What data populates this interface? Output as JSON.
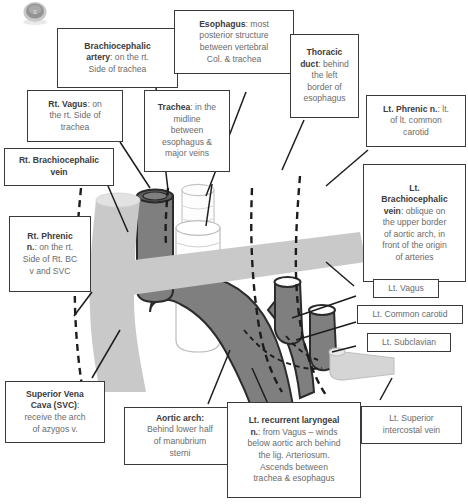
{
  "figure": {
    "kind": "anatomy-diagram",
    "watermark": "circular-logo-watermark"
  },
  "colors": {
    "vein": "#c9c9c9",
    "artery": "#7f7f7f",
    "outline": "#2b2b2b",
    "trachea": "#fdfdfd",
    "box_border": "#3a3a3a",
    "text": "#6b6b6b",
    "heading": "#3c3c3c",
    "background": "#ffffff"
  },
  "labels": [
    {
      "id": "brachiocephalic-artery",
      "term": "Brachiocephalic artery",
      "head": "Brachiocephalic artery:",
      "body": "on the rt. Side of trachea",
      "text": "Brachiocephalic artery: on the rt. Side of trachea"
    },
    {
      "id": "esophagus",
      "term": "Esophagus",
      "head": "Esophagus:",
      "body": "most posterior structure between vertebral Col. & trachea",
      "text": "Esophagus: most posterior structure between vertebral Col. & trachea"
    },
    {
      "id": "thoracic-duct",
      "term": "Thoracic duct",
      "head": "Thoracic duct:",
      "body": "behind the left border of esophagus",
      "text": "Thoracic duct: behind the left border of esophagus"
    },
    {
      "id": "lt-phrenic-nerve",
      "term": "Lt. Phrenic n.",
      "head": "Lt. Phrenic n.:",
      "body": "lt. of lt. common carotid",
      "text": "Lt. Phrenic n.: lt. of lt. common carotid"
    },
    {
      "id": "rt-vagus",
      "term": "Rt. Vagus",
      "head": "Rt. Vagus:",
      "body": "on the rt. Side of trachea",
      "text": "Rt. Vagus: on the rt. Side of trachea"
    },
    {
      "id": "trachea",
      "term": "Trachea",
      "head": "Trachea:",
      "body": "in the midline between esophagus & major veins",
      "text": "Trachea: in the midline between esophagus & major veins"
    },
    {
      "id": "rt-brachiocephalic-vein",
      "term": "Rt. Brachiocephalic vein",
      "head": "Rt. Brachiocephalic vein",
      "body": "",
      "text": "Rt. Brachiocephalic vein"
    },
    {
      "id": "lt-brachiocephalic-vein",
      "term": "Lt. Brachiocephalic vein",
      "head": "Lt. Brachiocephalic vein:",
      "body": "oblique on the upper border of aortic arch, in front of the origin of arteries",
      "text": "Lt. Brachiocephalic vein: oblique on the upper border of aortic arch, in front of the origin of arteries"
    },
    {
      "id": "rt-phrenic-nerve",
      "term": "Rt. Phrenic n.",
      "head": "Rt. Phrenic n.:",
      "body": "on the rt. Side of Rt. BC v and SVC",
      "text": "Rt. Phrenic n.: on the rt. Side of Rt. BC v and SVC"
    },
    {
      "id": "lt-vagus",
      "term": "Lt. Vagus",
      "head": "Lt. Vagus",
      "body": "",
      "text": "Lt. Vagus"
    },
    {
      "id": "lt-common-carotid",
      "term": "Lt. Common carotid",
      "head": "Lt. Common carotid",
      "body": "",
      "text": "Lt. Common carotid"
    },
    {
      "id": "lt-subclavian",
      "term": "Lt. Subclavian",
      "head": "Lt. Subclavian",
      "body": "",
      "text": "Lt. Subclavian"
    },
    {
      "id": "svc",
      "term": "Superior Vena Cava (SVC)",
      "head": "Superior Vena Cava (SVC):",
      "body": "receive the arch of azygos v.",
      "text": "Superior Vena Cava (SVC): receive the arch of azygos v."
    },
    {
      "id": "aortic-arch",
      "term": "Aortic arch",
      "head": "Aortic arch:",
      "body": "Behind lower half of manubrium sterni",
      "text": "Aortic arch: Behind lower half of manubrium sterni"
    },
    {
      "id": "lt-recurrent-laryngeal",
      "term": "Lt. recurrent laryngeal n.",
      "head": "Lt. recurrent laryngeal n.:",
      "body": "from Vagus – winds below aortic arch behind the lig. Arteriosum. Ascends between trachea & esophagus",
      "text": "Lt. recurrent laryngeal n.: from Vagus – winds below aortic arch behind the lig. Arteriosum. Ascends between trachea & esophagus"
    },
    {
      "id": "lt-superior-intercostal-vein",
      "term": "Lt. Superior intercostal vein",
      "head": "Lt. Superior intercostal vein",
      "body": "",
      "text": "Lt. Superior intercostal vein"
    }
  ],
  "label_text": {
    "brachiocephalic_artery_l1": "Brachiocephalic",
    "brachiocephalic_artery_l2": "artery",
    "brachiocephalic_artery_l3": ": on the rt.",
    "brachiocephalic_artery_l4": "Side of trachea",
    "esophagus_l1": "Esophagus",
    "esophagus_l2": ": most",
    "esophagus_l3": "posterior structure",
    "esophagus_l4": "between vertebral",
    "esophagus_l5": "Col. & trachea",
    "thoracic_duct_l1": "Thoracic",
    "thoracic_duct_l2": "duct",
    "thoracic_duct_l3": ": behind",
    "thoracic_duct_l4": "the left",
    "thoracic_duct_l5": "border of",
    "thoracic_duct_l6": "esophagus",
    "lt_phrenic_l1": "Lt. Phrenic n.",
    "lt_phrenic_l2": ": lt.",
    "lt_phrenic_l3": "of lt. common",
    "lt_phrenic_l4": "carotid",
    "rt_vagus_l1": "Rt. Vagus",
    "rt_vagus_l2": ": on",
    "rt_vagus_l3": "the rt. Side of",
    "rt_vagus_l4": "trachea",
    "trachea_l1": "Trachea",
    "trachea_l2": ": in the",
    "trachea_l3": "midline",
    "trachea_l4": "between",
    "trachea_l5": "esophagus &",
    "trachea_l6": "major veins",
    "rt_bc_vein_l1": "Rt. Brachiocephalic",
    "rt_bc_vein_l2": "vein",
    "lt_bc_vein_l1": "Lt.",
    "lt_bc_vein_l2": "Brachiocephalic",
    "lt_bc_vein_l3": "vein",
    "lt_bc_vein_l4": ": oblique on",
    "lt_bc_vein_l5": "the upper border",
    "lt_bc_vein_l6": "of aortic arch, in",
    "lt_bc_vein_l7": "front of the origin",
    "lt_bc_vein_l8": "of arteries",
    "rt_phrenic_l1": "Rt. Phrenic",
    "rt_phrenic_l2": "n.",
    "rt_phrenic_l3": ": on the rt.",
    "rt_phrenic_l4": "Side of Rt. BC",
    "rt_phrenic_l5": "v and SVC",
    "lt_vagus": "Lt. Vagus",
    "lt_common_carotid": "Lt. Common carotid",
    "lt_subclavian": "Lt. Subclavian",
    "svc_l1": "Superior Vena",
    "svc_l2": "Cava (SVC)",
    "svc_l3": ":",
    "svc_l4": "receive the arch",
    "svc_l5": "of azygos v.",
    "aortic_arch_l1": "Aortic arch:",
    "aortic_arch_l2": "Behind lower half",
    "aortic_arch_l3": "of manubrium",
    "aortic_arch_l4": "sterni",
    "lrl_l1": "Lt. recurrent laryngeal",
    "lrl_l2": "n.",
    "lrl_l3": ": from Vagus – winds",
    "lrl_l4": "below aortic arch behind",
    "lrl_l5": "the lig. Arteriosum.",
    "lrl_l6": "Ascends between",
    "lrl_l7": "trachea & esophagus",
    "lsiv_l1": "Lt. Superior",
    "lsiv_l2": "intercostal vein"
  },
  "structures": [
    {
      "id": "svc-rt-bc-vein",
      "name": "Superior vena cava / Rt. brachiocephalic vein",
      "fill": "vein"
    },
    {
      "id": "lt-bc-vein",
      "name": "Lt. brachiocephalic vein",
      "fill": "vein"
    },
    {
      "id": "brachiocephalic-artery-trunk",
      "name": "Brachiocephalic artery",
      "fill": "artery"
    },
    {
      "id": "aortic-arch-shape",
      "name": "Aortic arch",
      "fill": "artery"
    },
    {
      "id": "lt-common-carotid-artery",
      "name": "Lt. common carotid artery",
      "fill": "artery"
    },
    {
      "id": "lt-subclavian-artery",
      "name": "Lt. subclavian artery",
      "fill": "artery"
    },
    {
      "id": "trachea-shape",
      "name": "Trachea",
      "fill": "trachea"
    },
    {
      "id": "esophagus-shape",
      "name": "Esophagus",
      "fill": "trachea"
    },
    {
      "id": "lt-superior-intercostal-vein-shape",
      "name": "Lt. superior intercostal vein",
      "fill": "vein"
    },
    {
      "id": "rt-phrenic-nerve-path",
      "name": "Rt. phrenic nerve (dashed)",
      "fill": "none"
    },
    {
      "id": "rt-vagus-path",
      "name": "Rt. vagus nerve (dashed)",
      "fill": "none"
    },
    {
      "id": "lt-phrenic-nerve-path",
      "name": "Lt. phrenic nerve (dashed)",
      "fill": "none"
    },
    {
      "id": "lt-vagus-path",
      "name": "Lt. vagus nerve (dashed)",
      "fill": "none"
    },
    {
      "id": "lt-recurrent-laryngeal-path",
      "name": "Lt. recurrent laryngeal nerve (dashed)",
      "fill": "none"
    },
    {
      "id": "thoracic-duct-path",
      "name": "Thoracic duct (dashed)",
      "fill": "none"
    }
  ]
}
